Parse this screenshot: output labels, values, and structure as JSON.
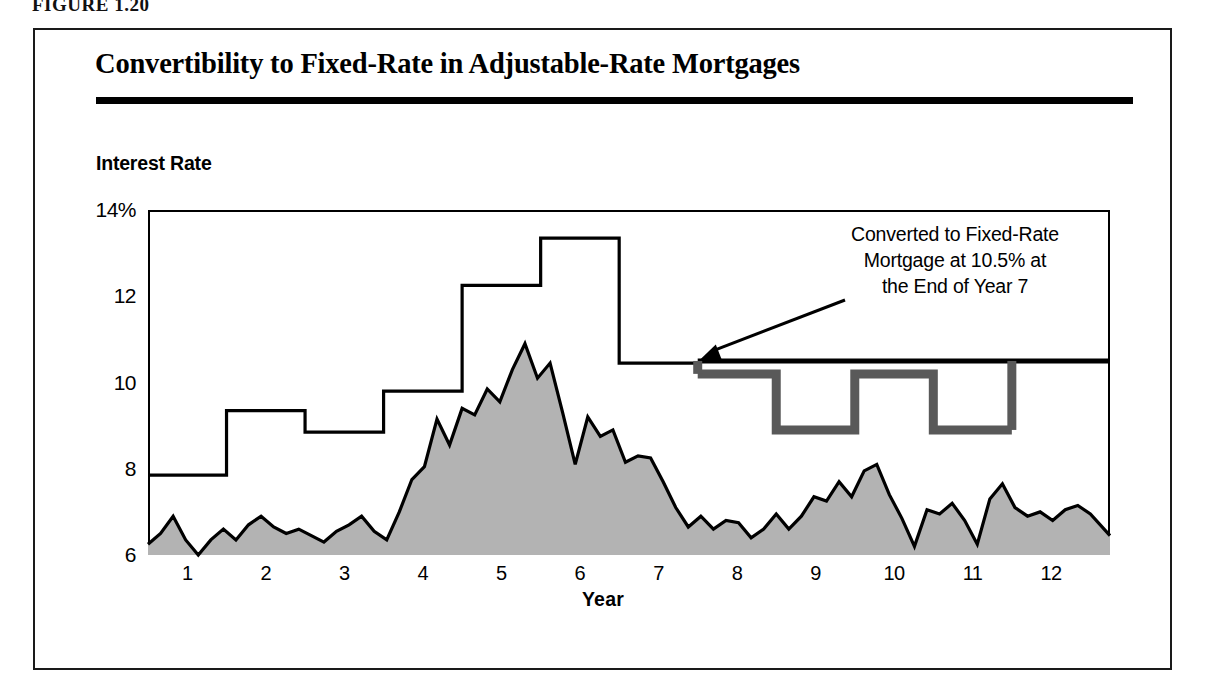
{
  "figure": {
    "caption": "FIGURE 1.20"
  },
  "chart_title": "Convertibility to Fixed-Rate in Adjustable-Rate Mortgages",
  "axis": {
    "y_label": "Interest Rate",
    "x_label": "Year",
    "y_ticks": [
      "14%",
      "12",
      "10",
      "8",
      "6"
    ],
    "x_ticks": [
      "1",
      "2",
      "3",
      "4",
      "5",
      "6",
      "7",
      "8",
      "9",
      "10",
      "11",
      "12"
    ]
  },
  "annotation": {
    "line1": "Converted to Fixed-Rate",
    "line2": "Mortgage at 10.5% at",
    "line3": "the End of Year 7"
  },
  "colors": {
    "index_fill": "#b3b3b3",
    "index_stroke": "#000000",
    "arm_step": "#000000",
    "fixed_rate_line": "#000000",
    "counterfactual_step": "#595959",
    "frame": "#000000"
  },
  "chart_data": {
    "type": "area",
    "title": "Convertibility to Fixed-Rate in Adjustable-Rate Mortgages",
    "xlabel": "Year",
    "ylabel": "Interest Rate",
    "xlim": [
      0.5,
      12.75
    ],
    "ylim": [
      6,
      14
    ],
    "ytick_values": [
      6,
      8,
      10,
      12,
      14
    ],
    "xtick_values": [
      1,
      2,
      3,
      4,
      5,
      6,
      7,
      8,
      9,
      10,
      11,
      12
    ],
    "grid": false,
    "legend": "none",
    "series": [
      {
        "name": "Index Rate",
        "type": "area",
        "fill": "#b3b3b3",
        "x": [
          0.5,
          0.66,
          0.82,
          0.98,
          1.14,
          1.3,
          1.46,
          1.62,
          1.78,
          1.94,
          2.1,
          2.26,
          2.42,
          2.58,
          2.74,
          2.9,
          3.06,
          3.22,
          3.38,
          3.54,
          3.7,
          3.86,
          4.02,
          4.18,
          4.34,
          4.5,
          4.66,
          4.82,
          4.98,
          5.14,
          5.3,
          5.46,
          5.62,
          5.78,
          5.94,
          6.1,
          6.26,
          6.42,
          6.58,
          6.74,
          6.9,
          7.06,
          7.22,
          7.38,
          7.54,
          7.7,
          7.86,
          8.02,
          8.18,
          8.34,
          8.5,
          8.66,
          8.82,
          8.98,
          9.14,
          9.3,
          9.46,
          9.62,
          9.78,
          9.94,
          10.1,
          10.26,
          10.42,
          10.58,
          10.74,
          10.9,
          11.06,
          11.22,
          11.38,
          11.54,
          11.7,
          11.86,
          12.02,
          12.18,
          12.34,
          12.5,
          12.75
        ],
        "y": [
          6.25,
          6.5,
          6.9,
          6.35,
          6.0,
          6.35,
          6.6,
          6.35,
          6.7,
          6.9,
          6.65,
          6.5,
          6.6,
          6.45,
          6.3,
          6.55,
          6.7,
          6.9,
          6.55,
          6.35,
          7.0,
          7.75,
          8.05,
          9.15,
          8.55,
          9.4,
          9.25,
          9.85,
          9.55,
          10.3,
          10.9,
          10.1,
          10.45,
          9.3,
          8.1,
          9.2,
          8.75,
          8.9,
          8.15,
          8.3,
          8.25,
          7.7,
          7.1,
          6.65,
          6.9,
          6.6,
          6.8,
          6.75,
          6.4,
          6.6,
          6.95,
          6.6,
          6.9,
          7.35,
          7.25,
          7.7,
          7.35,
          7.95,
          8.1,
          7.4,
          6.85,
          6.2,
          7.05,
          6.95,
          7.2,
          6.8,
          6.25,
          7.3,
          7.65,
          7.1,
          6.9,
          7.0,
          6.8,
          7.05,
          7.15,
          6.95,
          6.45
        ]
      },
      {
        "name": "Adjustable Rate (ARM) before conversion",
        "type": "step",
        "note": "Step changes occur at mid-year boundaries",
        "x_steps": [
          0.5,
          1.5,
          2.5,
          3.5,
          4.5,
          5.5,
          6.5,
          7.5
        ],
        "y_steps": [
          7.85,
          9.35,
          8.85,
          9.8,
          12.25,
          13.35,
          10.45
        ]
      },
      {
        "name": "Fixed Rate after conversion",
        "type": "line",
        "value": 10.5,
        "x_start": 7.5,
        "x_end": 12.75
      },
      {
        "name": "Hypothetical ARM after conversion",
        "type": "step",
        "color": "#595959",
        "x_steps": [
          7.5,
          8.5,
          9.5,
          10.5,
          11.5
        ],
        "y_steps": [
          10.2,
          8.9,
          10.2,
          8.9
        ]
      }
    ],
    "annotations": [
      {
        "text": "Converted to Fixed-Rate Mortgage at 10.5% at the End of Year 7",
        "points_to_x": 7.5,
        "points_to_y": 10.5
      }
    ]
  }
}
